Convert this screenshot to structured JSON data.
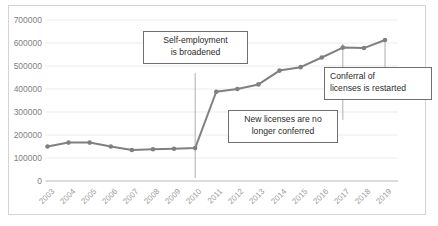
{
  "chart_data": {
    "type": "line",
    "title": "",
    "xlabel": "",
    "ylabel": "",
    "categories": [
      "2003",
      "2004",
      "2005",
      "2006",
      "2007",
      "2008",
      "2009",
      "2010",
      "2011",
      "2012",
      "2013",
      "2014",
      "2015",
      "2016",
      "2017",
      "2018",
      "2019"
    ],
    "values": [
      150000,
      167000,
      167000,
      150000,
      135000,
      138000,
      140000,
      143000,
      388000,
      400000,
      420000,
      480000,
      495000,
      537000,
      580000,
      578000,
      613000
    ],
    "series": [
      {
        "name": "Number of licenses",
        "values": [
          150000,
          167000,
          167000,
          150000,
          135000,
          138000,
          140000,
          143000,
          388000,
          400000,
          420000,
          480000,
          495000,
          537000,
          580000,
          578000,
          613000
        ]
      }
    ],
    "ylim": [
      0,
      700000
    ],
    "ytick_labels": [
      "0",
      "100000",
      "200000",
      "300000",
      "400000",
      "500000",
      "600000",
      "700000"
    ],
    "ytick_values": [
      0,
      100000,
      200000,
      300000,
      400000,
      500000,
      600000,
      700000
    ],
    "grid": true,
    "legend": "none",
    "legend_position": "none",
    "line_color": "#808080",
    "marker_color": "#808080",
    "grid_color": "#e6e6e6",
    "annotations": [
      {
        "id": "self-employment",
        "lines": [
          "Self-employment",
          "is broadened"
        ],
        "anchor_category": "2010",
        "align": "center"
      },
      {
        "id": "new-licenses",
        "lines": [
          "New licenses are no",
          "longer  conferred"
        ],
        "anchor_category": "2017",
        "align": "center"
      },
      {
        "id": "conferral-restarted",
        "lines": [
          "Conferral of",
          "licenses is restarted"
        ],
        "anchor_category": "2019",
        "align": "left"
      }
    ]
  }
}
